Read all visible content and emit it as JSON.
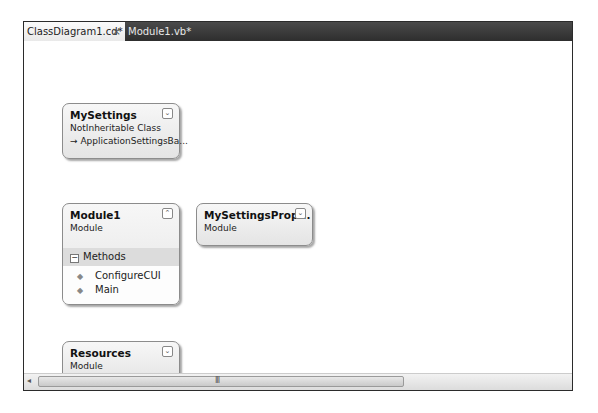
{
  "tabs": [
    {
      "label": "ClassDiagram1.cd*",
      "active": true,
      "close_glyph": "×"
    },
    {
      "label": "Module1.vb*",
      "active": false
    }
  ],
  "shapes": {
    "mysettings": {
      "title": "MySettings",
      "kind": "NotInheritable Class",
      "inherits": "→ ApplicationSettingsBa...",
      "toggle_icon": "expand-icon",
      "toggle_glyph": "⌄"
    },
    "module1": {
      "title": "Module1",
      "kind": "Module",
      "toggle_icon": "collapse-icon",
      "toggle_glyph": "⌃",
      "section": {
        "label": "Methods",
        "toggle_glyph": "−"
      },
      "members": [
        {
          "name": "ConfigureCUI",
          "icon": "method-icon",
          "glyph": "◆"
        },
        {
          "name": "Main",
          "icon": "method-icon",
          "glyph": "◆"
        }
      ]
    },
    "mysettingsprop": {
      "title": "MySettingsProp...",
      "kind": "Module",
      "toggle_icon": "expand-icon",
      "toggle_glyph": "⌄"
    },
    "resources": {
      "title": "Resources",
      "kind": "Module",
      "toggle_icon": "expand-icon",
      "toggle_glyph": "⌄"
    }
  },
  "scrollbar": {
    "left_arrow": "◂",
    "grip": "III"
  }
}
